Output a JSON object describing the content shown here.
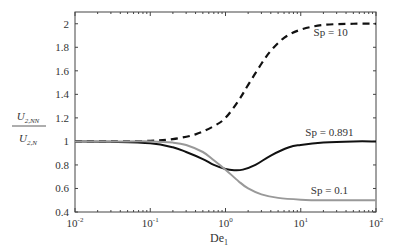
{
  "chart_data": {
    "type": "line",
    "title": "",
    "xlabel": "De",
    "xlabel_sub": "1",
    "ylabel_num": "U",
    "ylabel_num_sub": "2,NN",
    "ylabel_den": "U",
    "ylabel_den_sub": "2,N",
    "xscale": "log",
    "xlim": [
      0.01,
      100
    ],
    "ylim": [
      0.4,
      2.1
    ],
    "grid": false,
    "legend_position": "inline annotations",
    "x_ticks": [
      {
        "base": "10",
        "exp": "-2",
        "value": 0.01
      },
      {
        "base": "10",
        "exp": "-1",
        "value": 0.1
      },
      {
        "base": "10",
        "exp": "0",
        "value": 1
      },
      {
        "base": "10",
        "exp": "1",
        "value": 10
      },
      {
        "base": "10",
        "exp": "2",
        "value": 100
      }
    ],
    "y_ticks": [
      "0.4",
      "0.6",
      "0.8",
      "1",
      "1.2",
      "1.4",
      "1.6",
      "1.8",
      "2"
    ],
    "series": [
      {
        "name": "Sp = 10",
        "style": "dashed",
        "color": "#111111",
        "label_pos": {
          "De": 25,
          "v": 1.9
        },
        "x": [
          0.01,
          0.03,
          0.1,
          0.2,
          0.4,
          0.7,
          1.0,
          1.5,
          2.0,
          3.0,
          4.0,
          6.0,
          10,
          20,
          50,
          100
        ],
        "values": [
          1.0,
          1.0,
          1.005,
          1.02,
          1.06,
          1.13,
          1.2,
          1.35,
          1.48,
          1.66,
          1.77,
          1.88,
          1.95,
          1.99,
          2.0,
          2.0
        ]
      },
      {
        "name": "Sp = 0.891",
        "style": "solid",
        "color": "#111111",
        "label_pos": {
          "De": 24,
          "v": 1.045
        },
        "x": [
          0.01,
          0.03,
          0.1,
          0.2,
          0.3,
          0.5,
          0.7,
          1.0,
          1.3,
          1.7,
          2.5,
          4.0,
          7.0,
          10,
          20,
          50,
          100
        ],
        "values": [
          1.0,
          0.997,
          0.985,
          0.95,
          0.91,
          0.85,
          0.8,
          0.765,
          0.755,
          0.76,
          0.8,
          0.88,
          0.95,
          0.97,
          0.99,
          1.0,
          1.0
        ]
      },
      {
        "name": "Sp = 0.1",
        "style": "solid",
        "color": "#999999",
        "label_pos": {
          "De": 24,
          "v": 0.555
        },
        "x": [
          0.01,
          0.05,
          0.1,
          0.2,
          0.3,
          0.5,
          0.7,
          1.0,
          1.5,
          2.0,
          3.0,
          5.0,
          10,
          20,
          100
        ],
        "values": [
          1.0,
          1.0,
          1.0,
          0.99,
          0.97,
          0.91,
          0.84,
          0.76,
          0.66,
          0.6,
          0.55,
          0.52,
          0.505,
          0.5,
          0.5
        ]
      }
    ]
  }
}
